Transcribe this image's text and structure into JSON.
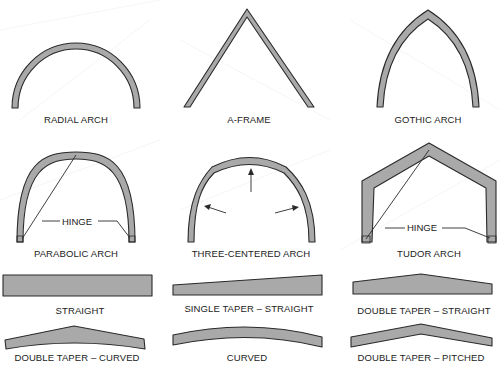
{
  "figure": {
    "fill_color": "#a9a9a9",
    "stroke_color": "#2a2a2a"
  },
  "arches": [
    {
      "id": "radial",
      "label": "RADIAL ARCH"
    },
    {
      "id": "a-frame",
      "label": "A-FRAME"
    },
    {
      "id": "gothic",
      "label": "GOTHIC ARCH"
    },
    {
      "id": "parabolic",
      "label": "PARABOLIC ARCH",
      "annotation": "HINGE"
    },
    {
      "id": "three-centered",
      "label": "THREE-CENTERED ARCH"
    },
    {
      "id": "tudor",
      "label": "TUDOR ARCH",
      "annotation": "HINGE"
    }
  ],
  "beams": [
    {
      "id": "straight",
      "label": "STRAIGHT"
    },
    {
      "id": "single-taper-straight",
      "label": "SINGLE TAPER – STRAIGHT"
    },
    {
      "id": "double-taper-straight",
      "label": "DOUBLE TAPER – STRAIGHT"
    },
    {
      "id": "double-taper-curved",
      "label": "DOUBLE TAPER – CURVED"
    },
    {
      "id": "curved",
      "label": "CURVED"
    },
    {
      "id": "double-taper-pitched",
      "label": "DOUBLE TAPER – PITCHED"
    }
  ]
}
